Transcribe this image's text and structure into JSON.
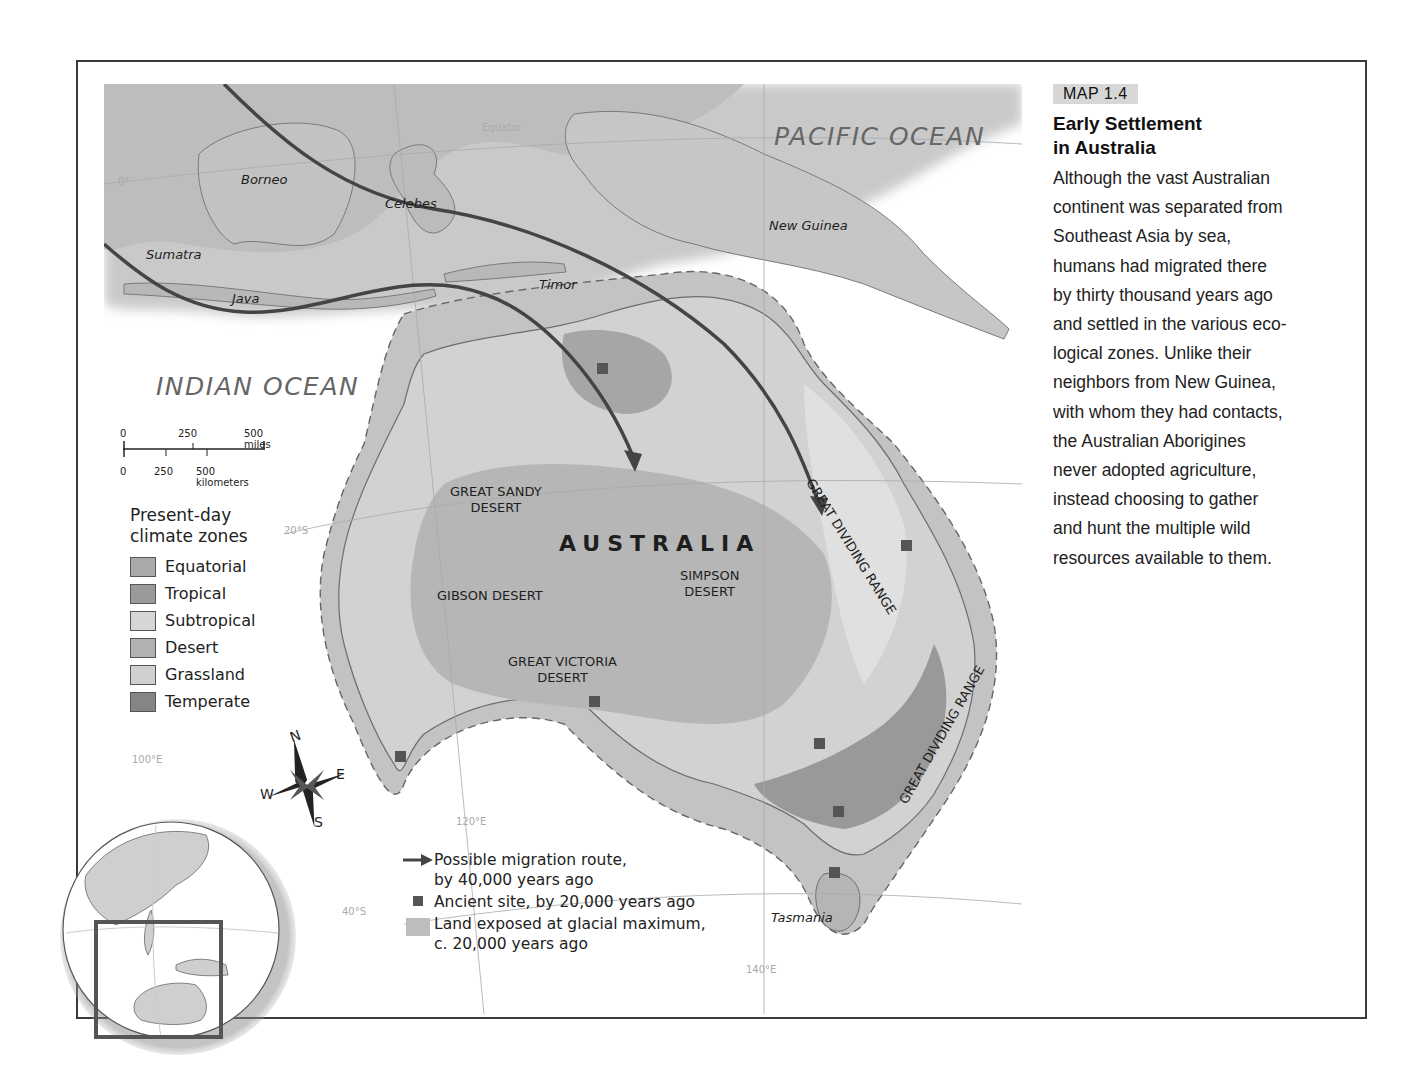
{
  "sidebar": {
    "badge": "MAP 1.4",
    "title_line1": "Early Settlement",
    "title_line2": "in Australia",
    "body_lines": [
      "Although the vast Australian",
      "continent was separated from",
      "Southeast Asia by sea,",
      "humans had migrated there",
      "by thirty thousand years ago",
      "and settled in the various eco-",
      "logical zones. Unlike their",
      "neighbors from New Guinea,",
      "with whom they had contacts,",
      "the Australian Aborigines",
      "never adopted agriculture,",
      "instead choosing to gather",
      "and hunt the multiple wild",
      "resources available to them."
    ]
  },
  "map": {
    "oceans": {
      "pacific": "PACIFIC OCEAN",
      "indian": "INDIAN OCEAN"
    },
    "places": {
      "borneo": "Borneo",
      "celebes": "Celebes",
      "sumatra": "Sumatra",
      "java": "Java",
      "timor": "Timor",
      "new_guinea": "New Guinea",
      "tasmania": "Tasmania",
      "australia": "AUSTRALIA"
    },
    "deserts": {
      "great_sandy_1": "GREAT SANDY",
      "great_sandy_2": "DESERT",
      "gibson": "GIBSON DESERT",
      "simpson_1": "SIMPSON",
      "simpson_2": "DESERT",
      "great_victoria_1": "GREAT VICTORIA",
      "great_victoria_2": "DESERT"
    },
    "ranges": {
      "north": "GREAT DIVIDING RANGE",
      "south": "GREAT DIVIDING RANGE"
    },
    "gridlines": {
      "equator": "Equator",
      "zero": "0°",
      "lat20": "20°S",
      "lat40": "40°S",
      "lon100": "100°E",
      "lon120": "120°E",
      "lon140": "140°E"
    },
    "compass": {
      "n": "N",
      "s": "S",
      "e": "E",
      "w": "W"
    }
  },
  "scale_bar": {
    "miles": [
      "0",
      "250",
      "500 miles"
    ],
    "km": [
      "0",
      "250",
      "500 kilometers"
    ]
  },
  "climate_legend": {
    "heading_line1": "Present-day",
    "heading_line2": "climate zones",
    "items": [
      {
        "label": "Equatorial",
        "color": "#a9a9a9"
      },
      {
        "label": "Tropical",
        "color": "#9a9a9a"
      },
      {
        "label": "Subtropical",
        "color": "#d6d6d6"
      },
      {
        "label": "Desert",
        "color": "#b1b1b1"
      },
      {
        "label": "Grassland",
        "color": "#d0d0d0"
      },
      {
        "label": "Temperate",
        "color": "#858585"
      }
    ]
  },
  "symbol_key": {
    "route_line1": "Possible migration route,",
    "route_line2": "by 40,000 years ago",
    "site": "Ancient site, by 20,000 years ago",
    "land_line1": "Land exposed at glacial maximum,",
    "land_line2": "c. 20,000 years ago"
  },
  "colors": {
    "frame": "#3a3a3a",
    "land": "#cfcfcf",
    "exposed_land": "#bdbdbd",
    "route": "#4a4a4a",
    "site": "#555555",
    "badge_bg": "#d7d7d7"
  }
}
